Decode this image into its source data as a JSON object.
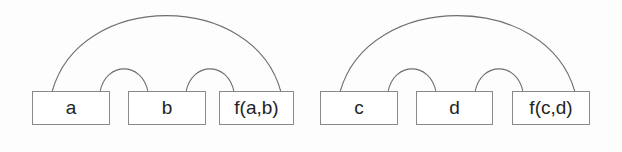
{
  "figure": {
    "title": "",
    "background_color": "#fdfdfd",
    "box_fill": "#ffffff",
    "box_border_color": "#8a8a8a",
    "arc_stroke_color": "#6f6f6f",
    "text_color": "#232323"
  },
  "groups": [
    {
      "id": "group-left",
      "nodes": [
        {
          "id": "node-a",
          "label": "a",
          "x": 32,
          "y": 91,
          "width": 78,
          "height": 34
        },
        {
          "id": "node-b",
          "label": "b",
          "x": 128,
          "y": 91,
          "width": 78,
          "height": 34
        },
        {
          "id": "node-fab",
          "label": "f(a,b)",
          "x": 219,
          "y": 91,
          "width": 75,
          "height": 34
        }
      ],
      "arcs": [
        {
          "id": "arc-a-fab",
          "kind": "major",
          "from": "node-a",
          "to": "node-fab",
          "x1": 52,
          "y1": 92,
          "x2": 281,
          "y2": 92,
          "peak_y": 16
        },
        {
          "id": "arc-a-b",
          "kind": "minor",
          "from": "node-a",
          "to": "node-b",
          "x1": 100,
          "y1": 92,
          "x2": 148,
          "y2": 92,
          "peak_y": 69
        },
        {
          "id": "arc-b-fab",
          "kind": "minor",
          "from": "node-b",
          "to": "node-fab",
          "x1": 186,
          "y1": 92,
          "x2": 234,
          "y2": 92,
          "peak_y": 69
        }
      ]
    },
    {
      "id": "group-right",
      "nodes": [
        {
          "id": "node-c",
          "label": "c",
          "x": 320,
          "y": 91,
          "width": 78,
          "height": 34
        },
        {
          "id": "node-d",
          "label": "d",
          "x": 416,
          "y": 91,
          "width": 77,
          "height": 34
        },
        {
          "id": "node-fcd",
          "label": "f(c,d)",
          "x": 512,
          "y": 91,
          "width": 78,
          "height": 34
        }
      ],
      "arcs": [
        {
          "id": "arc-c-fcd",
          "kind": "major",
          "from": "node-c",
          "to": "node-fcd",
          "x1": 340,
          "y1": 92,
          "x2": 575,
          "y2": 92,
          "peak_y": 16
        },
        {
          "id": "arc-c-d",
          "kind": "minor",
          "from": "node-c",
          "to": "node-d",
          "x1": 388,
          "y1": 92,
          "x2": 436,
          "y2": 92,
          "peak_y": 69
        },
        {
          "id": "arc-d-fcd",
          "kind": "minor",
          "from": "node-d",
          "to": "node-fcd",
          "x1": 475,
          "y1": 92,
          "x2": 523,
          "y2": 92,
          "peak_y": 69
        }
      ]
    }
  ]
}
